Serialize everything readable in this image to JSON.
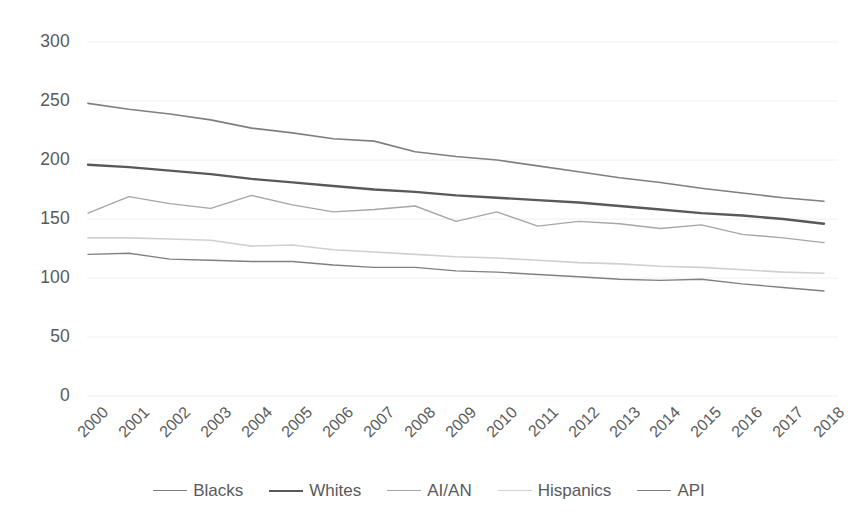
{
  "chart_data": {
    "type": "line",
    "title": "",
    "subtitle": "",
    "xlabel": "",
    "ylabel": "",
    "grid": true,
    "legend_position": "bottom",
    "xlim": [
      2000,
      2018
    ],
    "ylim": [
      0,
      300
    ],
    "ytick_values": [
      300,
      250,
      200,
      150,
      100,
      50,
      0
    ],
    "ytick_labels": [
      "300",
      "250",
      "200",
      "150",
      "100",
      "50",
      "0"
    ],
    "categories": [
      2000,
      2001,
      2002,
      2003,
      2004,
      2005,
      2006,
      2007,
      2008,
      2009,
      2010,
      2011,
      2012,
      2013,
      2014,
      2015,
      2016,
      2017,
      2018
    ],
    "xtick_labels": [
      "2000",
      "2001",
      "2002",
      "2003",
      "2004",
      "2005",
      "2006",
      "2007",
      "2008",
      "2009",
      "2010",
      "2011",
      "2012",
      "2013",
      "2014",
      "2015",
      "2016",
      "2017",
      "2018"
    ],
    "series": [
      {
        "name": "Blacks",
        "color": "#7f7f7f",
        "width": 1.6,
        "values": [
          248,
          243,
          239,
          234,
          227,
          223,
          218,
          216,
          207,
          203,
          200,
          195,
          190,
          185,
          181,
          176,
          172,
          168,
          165
        ]
      },
      {
        "name": "Whites",
        "color": "#595959",
        "width": 2.4,
        "values": [
          196,
          194,
          191,
          188,
          184,
          181,
          178,
          175,
          173,
          170,
          168,
          166,
          164,
          161,
          158,
          155,
          153,
          150,
          146
        ]
      },
      {
        "name": "AI/AN",
        "color": "#a6a6a6",
        "width": 1.4,
        "values": [
          155,
          169,
          163,
          159,
          170,
          162,
          156,
          158,
          161,
          148,
          156,
          144,
          148,
          146,
          142,
          145,
          137,
          134,
          130
        ]
      },
      {
        "name": "Hispanics",
        "color": "#d0d0d0",
        "width": 1.6,
        "values": [
          134,
          134,
          133,
          132,
          127,
          128,
          124,
          122,
          120,
          118,
          117,
          115,
          113,
          112,
          110,
          109,
          107,
          105,
          104
        ]
      },
      {
        "name": "API",
        "color": "#808080",
        "width": 1.4,
        "values": [
          120,
          121,
          116,
          115,
          114,
          114,
          111,
          109,
          109,
          106,
          105,
          103,
          101,
          99,
          98,
          99,
          95,
          92,
          89
        ]
      }
    ]
  },
  "legend": {
    "items": [
      {
        "label": "Blacks"
      },
      {
        "label": "Whites"
      },
      {
        "label": "AI/AN"
      },
      {
        "label": "Hispanics"
      },
      {
        "label": "API"
      }
    ]
  },
  "colors": {
    "background": "#ffffff",
    "gridline": "#f0f0f0",
    "text": "#5a5a5a"
  }
}
